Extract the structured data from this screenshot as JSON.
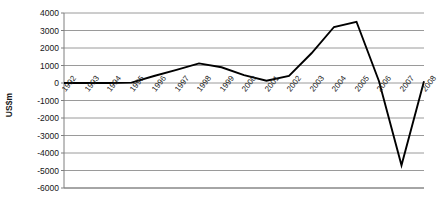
{
  "chart_data": {
    "type": "line",
    "title": "",
    "xlabel": "",
    "ylabel": "US$m",
    "categories": [
      "1992",
      "1993",
      "1994",
      "1995",
      "1996",
      "1997",
      "1998",
      "1999",
      "2000",
      "2001",
      "2002",
      "2003",
      "2004",
      "2005",
      "2006",
      "2007",
      "2008"
    ],
    "values": [
      0,
      0,
      0,
      20,
      400,
      750,
      1120,
      900,
      450,
      130,
      400,
      1700,
      3200,
      3500,
      100,
      -4700,
      100
    ],
    "series": [
      {
        "name": "US$m",
        "values": [
          0,
          0,
          0,
          20,
          400,
          750,
          1120,
          900,
          450,
          130,
          400,
          1700,
          3200,
          3500,
          100,
          -4700,
          100
        ]
      }
    ],
    "ylim": [
      -6000,
      4000
    ],
    "yticks": [
      4000,
      3000,
      2000,
      1000,
      0,
      -1000,
      -2000,
      -3000,
      -4000,
      -5000,
      -6000
    ],
    "ytick_labels": [
      "4000",
      "3000",
      "2000",
      "1000",
      "0",
      "-1000",
      "-2000",
      "-3000",
      "-4000",
      "-5000",
      "-6000"
    ],
    "grid": "horizontal",
    "legend": "none",
    "line_color": "#000000",
    "grid_color": "#9a9a9a",
    "border_color": "#7f7f7f",
    "background_color": "#ffffff"
  }
}
